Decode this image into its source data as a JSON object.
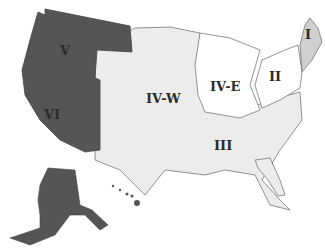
{
  "map": {
    "title": "",
    "colors": {
      "west_dark": "#555555",
      "new_england": "#cfcfcf",
      "light_region": "#ececec",
      "white_region": "#ffffff",
      "border": "#777777",
      "label": "#2b2b2b"
    },
    "regions": [
      {
        "id": "I",
        "label": "I",
        "area": "New England"
      },
      {
        "id": "II",
        "label": "II",
        "area": "Mid-Atlantic"
      },
      {
        "id": "III",
        "label": "III",
        "area": "Southeast"
      },
      {
        "id": "IV-E",
        "label": "IV-E",
        "area": "Great Lakes"
      },
      {
        "id": "IV-W",
        "label": "IV-W",
        "area": "Plains"
      },
      {
        "id": "V",
        "label": "V",
        "area": "Northwest"
      },
      {
        "id": "VI",
        "label": "VI",
        "area": "Southwest / Pacific incl. Alaska & Hawaii"
      }
    ]
  }
}
